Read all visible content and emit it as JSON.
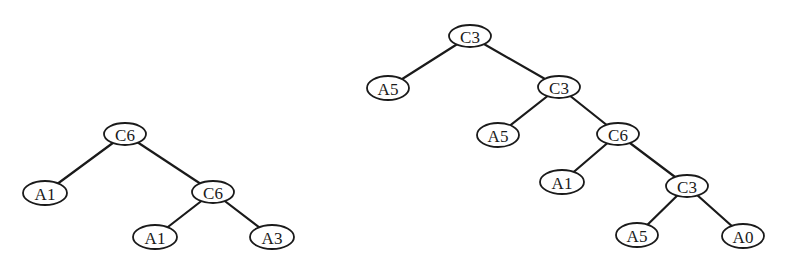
{
  "diagram": {
    "type": "binary-tree",
    "background": "#ffffff",
    "stroke_color": "#1a1a1a",
    "trees": [
      {
        "id": "left-tree",
        "nodes": [
          {
            "id": "L0",
            "label": "C6",
            "x": 125,
            "y": 134,
            "rx": 21,
            "ry": 11
          },
          {
            "id": "L1",
            "label": "A1",
            "x": 45,
            "y": 193,
            "rx": 22,
            "ry": 12
          },
          {
            "id": "L2",
            "label": "C6",
            "x": 213,
            "y": 192,
            "rx": 21,
            "ry": 11
          },
          {
            "id": "L3",
            "label": "A1",
            "x": 155,
            "y": 237,
            "rx": 22,
            "ry": 12
          },
          {
            "id": "L4",
            "label": "A3",
            "x": 272,
            "y": 237,
            "rx": 22,
            "ry": 12
          }
        ],
        "edges": [
          {
            "from": "L0",
            "to": "L1"
          },
          {
            "from": "L0",
            "to": "L2"
          },
          {
            "from": "L2",
            "to": "L3"
          },
          {
            "from": "L2",
            "to": "L4"
          }
        ]
      },
      {
        "id": "right-tree",
        "nodes": [
          {
            "id": "R0",
            "label": "C3",
            "x": 470,
            "y": 36,
            "rx": 21,
            "ry": 11
          },
          {
            "id": "R1",
            "label": "A5",
            "x": 388,
            "y": 88,
            "rx": 21,
            "ry": 12
          },
          {
            "id": "R2",
            "label": "C3",
            "x": 559,
            "y": 87,
            "rx": 21,
            "ry": 11
          },
          {
            "id": "R3",
            "label": "A5",
            "x": 498,
            "y": 135,
            "rx": 21,
            "ry": 12
          },
          {
            "id": "R4",
            "label": "C6",
            "x": 618,
            "y": 134,
            "rx": 21,
            "ry": 11
          },
          {
            "id": "R5",
            "label": "A1",
            "x": 562,
            "y": 182,
            "rx": 22,
            "ry": 12
          },
          {
            "id": "R6",
            "label": "C3",
            "x": 687,
            "y": 186,
            "rx": 21,
            "ry": 11
          },
          {
            "id": "R7",
            "label": "A5",
            "x": 637,
            "y": 235,
            "rx": 21,
            "ry": 12
          },
          {
            "id": "R8",
            "label": "A0",
            "x": 743,
            "y": 236,
            "rx": 21,
            "ry": 12
          }
        ],
        "edges": [
          {
            "from": "R0",
            "to": "R1"
          },
          {
            "from": "R0",
            "to": "R2"
          },
          {
            "from": "R2",
            "to": "R3"
          },
          {
            "from": "R2",
            "to": "R4"
          },
          {
            "from": "R4",
            "to": "R5"
          },
          {
            "from": "R4",
            "to": "R6"
          },
          {
            "from": "R6",
            "to": "R7"
          },
          {
            "from": "R6",
            "to": "R8"
          }
        ]
      }
    ]
  }
}
